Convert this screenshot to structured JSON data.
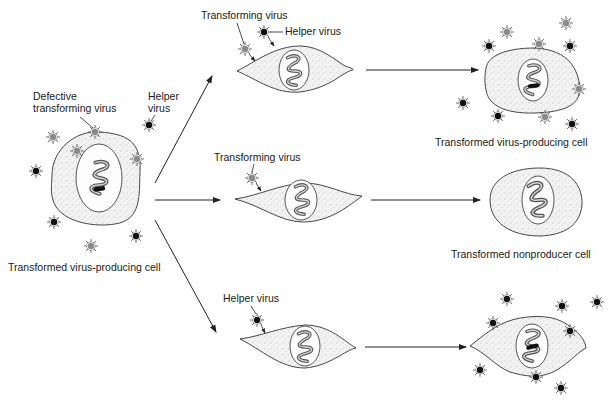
{
  "figure": {
    "type": "biology-diagram"
  },
  "labels": {
    "source_defective": "Defective",
    "source_transforming": "transforming virus",
    "source_helper_line1": "Helper",
    "source_helper_line2": "virus",
    "source_cell": "Transformed virus-producing cell",
    "top_transforming": "Transforming virus",
    "top_helper": "Helper virus",
    "top_result": "Transformed virus-producing cell",
    "middle_transforming": "Transforming virus",
    "middle_result": "Transformed nonproducer cell",
    "bottom_helper": "Helper virus"
  },
  "legend": {
    "transforming_virus_color": "#8a8a8a",
    "helper_virus_color": "#111111"
  },
  "pathways": [
    {
      "name": "top",
      "infecting": [
        "Transforming virus",
        "Helper virus"
      ],
      "outcome": "Transformed virus-producing cell"
    },
    {
      "name": "middle",
      "infecting": [
        "Transforming virus"
      ],
      "outcome": "Transformed nonproducer cell"
    },
    {
      "name": "bottom",
      "infecting": [
        "Helper virus"
      ],
      "outcome": ""
    }
  ]
}
